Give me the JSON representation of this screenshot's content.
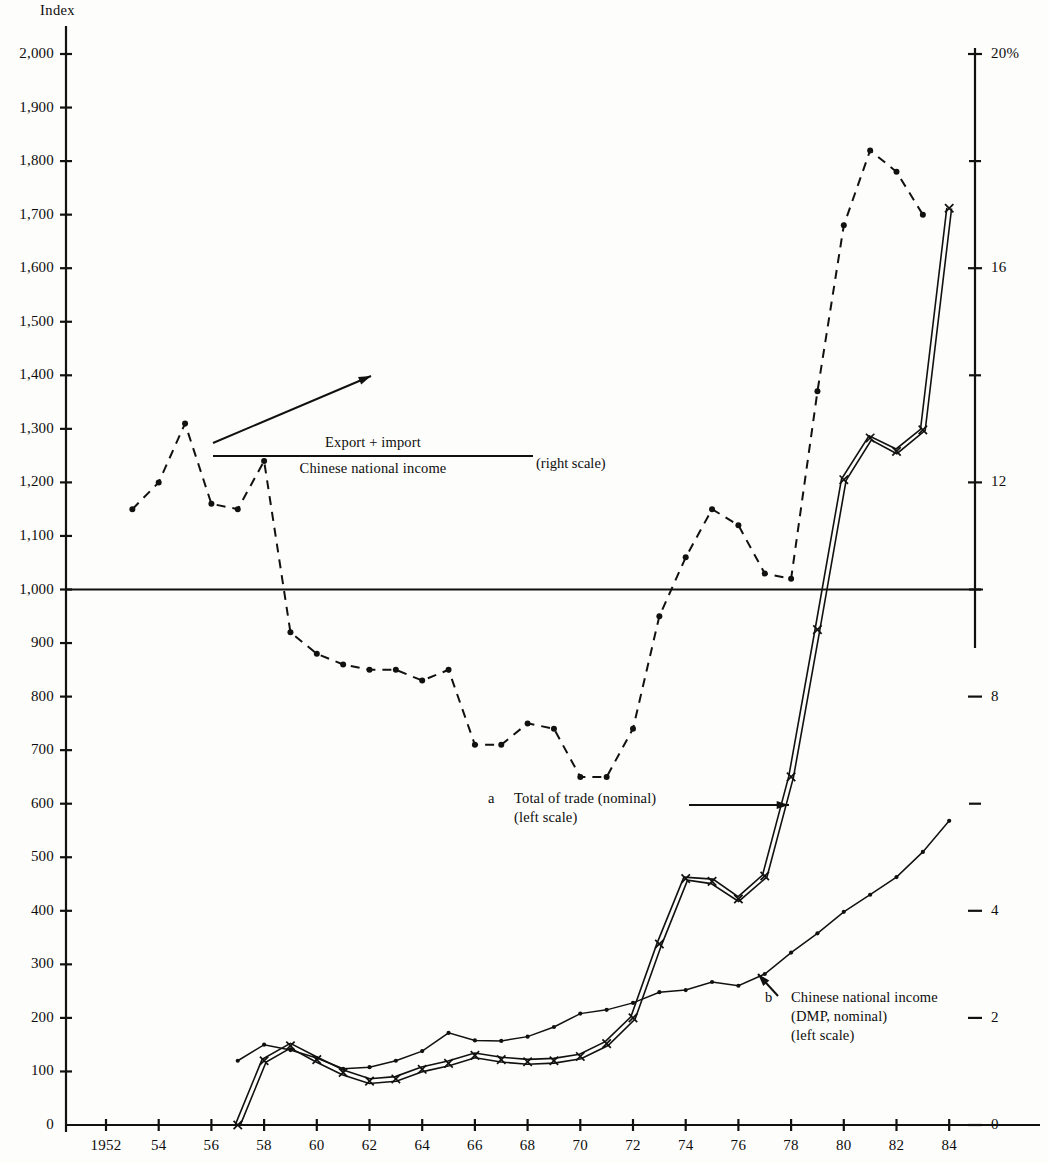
{
  "axes": {
    "left_title": "Index",
    "left_ticks": [
      "0",
      "100",
      "200",
      "300",
      "400",
      "500",
      "600",
      "700",
      "800",
      "900",
      "1,000",
      "1,100",
      "1,200",
      "1,300",
      "1,400",
      "1,500",
      "1,600",
      "1,700",
      "1,800",
      "1,900",
      "2,000"
    ],
    "right_ticks": [
      "0",
      "2",
      "4",
      "8",
      "12",
      "16",
      "20%"
    ],
    "x_ticks": [
      "1952",
      "54",
      "56",
      "58",
      "60",
      "62",
      "64",
      "66",
      "68",
      "70",
      "72",
      "74",
      "76",
      "78",
      "80",
      "82",
      "84"
    ]
  },
  "annotations": {
    "ratio_numerator": "Export + import",
    "ratio_denominator": "Chinese national income",
    "ratio_scale_note": "(right scale)",
    "series_a_index": "a",
    "series_a_line1": "Total of trade (nominal)",
    "series_a_line2": "(left scale)",
    "series_b_index": "b",
    "series_b_line1": "Chinese national income",
    "series_b_line2": "(DMP, nominal)",
    "series_b_line3": "(left scale)"
  },
  "colors": {
    "ink": "#111111",
    "background": "#fdfdfb"
  },
  "chart_data": {
    "type": "line",
    "title": "",
    "xlabel": "",
    "ylabel": "Index",
    "y2label": "%",
    "ylim": [
      0,
      2000
    ],
    "y2lim": [
      0,
      20
    ],
    "xlim": [
      1952,
      1985
    ],
    "grid": false,
    "legend": "inline-annotations",
    "x": [
      1952,
      1953,
      1954,
      1955,
      1956,
      1957,
      1958,
      1959,
      1960,
      1961,
      1962,
      1963,
      1964,
      1965,
      1966,
      1967,
      1968,
      1969,
      1970,
      1971,
      1972,
      1973,
      1974,
      1975,
      1976,
      1977,
      1978,
      1979,
      1980,
      1981,
      1982,
      1983,
      1984
    ],
    "series": [
      {
        "name": "a  Total of trade (nominal) (left scale)",
        "scale": "left",
        "style": "double-line-with-x-markers",
        "x": [
          1957,
          1958,
          1959,
          1960,
          1961,
          1962,
          1963,
          1964,
          1965,
          1966,
          1967,
          1968,
          1969,
          1970,
          1971,
          1972,
          1973,
          1974,
          1975,
          1976,
          1977,
          1978,
          1979,
          1980,
          1981,
          1982,
          1983,
          1984
        ],
        "values": [
          0,
          120,
          148,
          122,
          98,
          82,
          86,
          104,
          115,
          130,
          122,
          118,
          120,
          128,
          152,
          200,
          338,
          460,
          455,
          422,
          465,
          650,
          925,
          1205,
          1283,
          1258,
          1298,
          1712
        ]
      },
      {
        "name": "b  Chinese national income (DMP, nominal) (left scale)",
        "scale": "left",
        "style": "line-with-dot-markers",
        "x": [
          1957,
          1958,
          1959,
          1960,
          1961,
          1962,
          1963,
          1964,
          1965,
          1966,
          1967,
          1968,
          1969,
          1970,
          1971,
          1972,
          1973,
          1974,
          1975,
          1976,
          1977,
          1978,
          1979,
          1980,
          1981,
          1982,
          1983,
          1984
        ],
        "values": [
          120,
          150,
          140,
          125,
          105,
          108,
          120,
          138,
          172,
          158,
          157,
          165,
          183,
          208,
          215,
          228,
          248,
          252,
          267,
          260,
          282,
          322,
          358,
          398,
          430,
          463,
          510,
          568
        ]
      },
      {
        "name": "(Export + import) / (Chinese national income) (right scale)",
        "scale": "right",
        "style": "dashed-with-dot-markers",
        "units": "percent",
        "x": [
          1953,
          1954,
          1955,
          1956,
          1957,
          1958,
          1959,
          1960,
          1961,
          1962,
          1963,
          1964,
          1965,
          1966,
          1967,
          1968,
          1969,
          1970,
          1971,
          1972,
          1973,
          1974,
          1975,
          1976,
          1977,
          1978,
          1979,
          1980,
          1981,
          1982,
          1983
        ],
        "values": [
          11.5,
          12.0,
          13.1,
          11.6,
          11.5,
          12.4,
          9.2,
          8.8,
          8.6,
          8.5,
          8.5,
          8.3,
          8.5,
          7.1,
          7.1,
          7.5,
          7.4,
          6.5,
          6.5,
          7.4,
          9.5,
          10.6,
          11.5,
          11.2,
          10.3,
          10.2,
          13.7,
          16.8,
          18.2,
          17.8,
          17.0
        ]
      }
    ]
  }
}
